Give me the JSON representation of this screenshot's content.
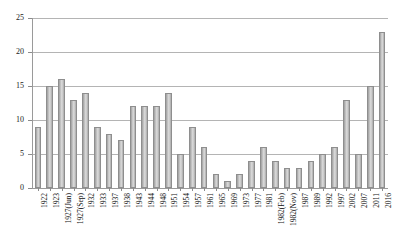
{
  "chart_data": {
    "type": "bar",
    "title": "",
    "xlabel": "",
    "ylabel": "",
    "ylim": [
      0,
      25
    ],
    "ytick_step": 5,
    "yticks": [
      0,
      5,
      10,
      15,
      20,
      25
    ],
    "grid": true,
    "legend": false,
    "bar_color": "#c8c8c8",
    "bar_edge_color": "#8e8e8e",
    "grid_color": "#b4b4b4",
    "axis_color": "#9a9a9a",
    "categories": [
      "1922",
      "1923",
      "1927(Jun)",
      "1927(Sep)",
      "1932",
      "1933",
      "1937",
      "1938",
      "1943",
      "1944",
      "1948",
      "1951",
      "1954",
      "1957",
      "1961",
      "1965",
      "1969",
      "1973",
      "1977",
      "1981",
      "1982(Feb)",
      "1982(Nov)",
      "1987",
      "1989",
      "1992",
      "1997",
      "2002",
      "2007",
      "2011",
      "2016"
    ],
    "values": [
      9,
      15,
      16,
      13,
      14,
      9,
      8,
      7,
      12,
      12,
      12,
      14,
      5,
      9,
      6,
      2,
      1,
      2,
      4,
      6,
      4,
      3,
      3,
      4,
      5,
      6,
      13,
      5,
      15,
      23
    ]
  }
}
